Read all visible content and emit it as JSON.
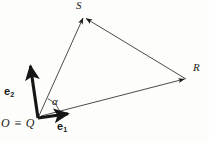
{
  "figure": {
    "background_color": "#fdfdfb",
    "stroke_color": "#1a1a1a",
    "width": 209,
    "height": 142,
    "points": {
      "origin": {
        "x": 38,
        "y": 118,
        "label": "O ≡ Q"
      },
      "S": {
        "x": 84,
        "y": 16,
        "label": "S"
      },
      "R": {
        "x": 186,
        "y": 79,
        "label": "R"
      }
    },
    "basis_vectors": [
      {
        "name": "e1",
        "label_base": "e",
        "label_sub": "1",
        "from_x": 38,
        "from_y": 118,
        "to_x": 74,
        "to_y": 113,
        "weight": "bold"
      },
      {
        "name": "e2",
        "label_base": "e",
        "label_sub": "2",
        "from_x": 38,
        "from_y": 118,
        "to_x": 29,
        "to_y": 60,
        "weight": "bold"
      }
    ],
    "vectors": [
      {
        "name": "origin-to-S",
        "from_x": 38,
        "from_y": 118,
        "to_x": 84,
        "to_y": 16,
        "weight": "thin"
      },
      {
        "name": "origin-to-R",
        "from_x": 40,
        "from_y": 116,
        "to_x": 186,
        "to_y": 79,
        "weight": "thin"
      },
      {
        "name": "R-to-S",
        "from_x": 186,
        "from_y": 79,
        "to_x": 84,
        "to_y": 16,
        "weight": "thin"
      }
    ],
    "angle": {
      "name": "alpha",
      "label": "α",
      "vertex_x": 38,
      "vertex_y": 118,
      "radius": 22
    }
  }
}
